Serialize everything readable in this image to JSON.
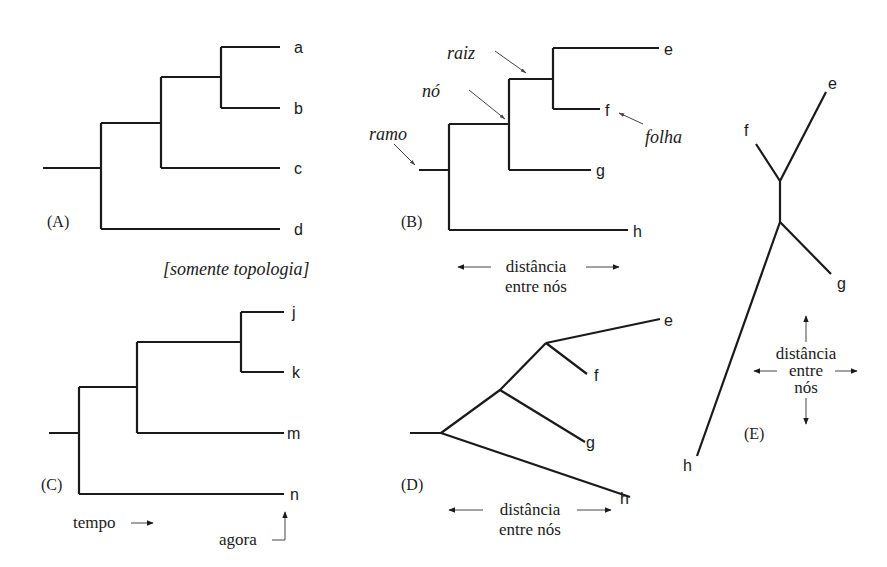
{
  "colors": {
    "line": "#1a1a1a",
    "background": "#ffffff"
  },
  "panels": {
    "A": {
      "label": "(A)",
      "leaves": [
        "a",
        "b",
        "c",
        "d"
      ],
      "caption": "[somente topologia]"
    },
    "B": {
      "label": "(B)",
      "leaves": [
        "e",
        "f",
        "g",
        "h"
      ],
      "annotations": {
        "root": "raiz",
        "node": "nó",
        "branch": "ramo",
        "leaf": "folha"
      },
      "scale_line1": "distância",
      "scale_line2": "entre nós"
    },
    "C": {
      "label": "(C)",
      "leaves": [
        "j",
        "k",
        "m",
        "n"
      ],
      "time_label": "tempo",
      "now_label": "agora"
    },
    "D": {
      "label": "(D)",
      "leaves": [
        "e",
        "f",
        "g",
        "h"
      ],
      "scale_line1": "distância",
      "scale_line2": "entre nós"
    },
    "E": {
      "label": "(E)",
      "leaves": [
        "e",
        "f",
        "g",
        "h"
      ],
      "scale_line1": "distância",
      "scale_line2": "entre",
      "scale_line3": "nós"
    }
  }
}
